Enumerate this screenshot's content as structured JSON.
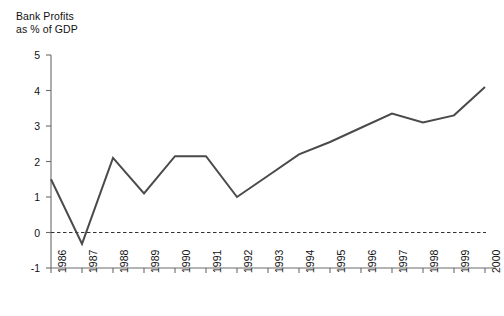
{
  "chart_data": {
    "type": "line",
    "title": "Bank Profits\nas % of GDP",
    "xlabel": "",
    "ylabel": "Bank Profits as % of GDP",
    "categories": [
      "1986",
      "1987",
      "1988",
      "1989",
      "1990",
      "1991",
      "1992",
      "1993",
      "1994",
      "1995",
      "1996",
      "1997",
      "1998",
      "1999",
      "2000"
    ],
    "values": [
      1.5,
      -0.32,
      2.1,
      1.1,
      2.15,
      2.15,
      1.0,
      1.6,
      2.2,
      2.55,
      2.95,
      3.35,
      3.1,
      3.3,
      4.1
    ],
    "series": [
      {
        "name": "Bank Profits as % of GDP",
        "values": [
          1.5,
          -0.32,
          2.1,
          1.1,
          2.15,
          2.15,
          1.0,
          1.6,
          2.2,
          2.55,
          2.95,
          3.35,
          3.1,
          3.3,
          4.1
        ]
      }
    ],
    "ylim": [
      -1,
      5
    ],
    "yticks": [
      "5",
      "4",
      "3",
      "2",
      "1",
      "0",
      "-1"
    ],
    "ytick_values": [
      5,
      4,
      3,
      2,
      1,
      0,
      -1
    ],
    "grid": false,
    "legend": "none",
    "zero_reference_line": {
      "value": 0,
      "style": "dashed",
      "color": "#333333"
    },
    "line_color": "#4a4a4a",
    "axis_color": "#6b6b6b"
  }
}
